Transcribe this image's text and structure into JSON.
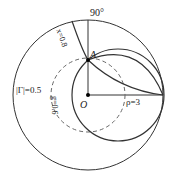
{
  "diagram": {
    "type": "smith-chart-sketch",
    "labels": {
      "angle": "90°",
      "point_a": "A",
      "origin": "O",
      "gamma_mag": "|Γ|=0.5",
      "g_circle": "g=0.6",
      "x_arc": "x=0.8",
      "rho": "ρ=3"
    },
    "colors": {
      "stroke": "#333333",
      "dashed": "#666666",
      "background": "#ffffff"
    }
  }
}
